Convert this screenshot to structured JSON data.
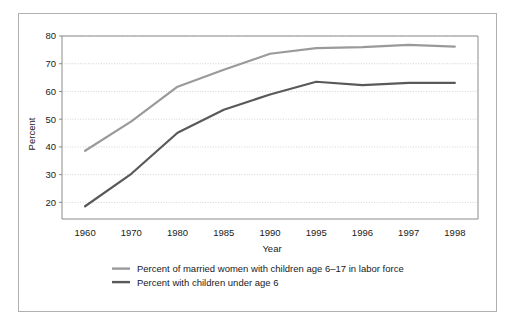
{
  "chart_data": {
    "type": "line",
    "title": "",
    "xlabel": "Year",
    "ylabel": "Percent",
    "categories": [
      "1960",
      "1970",
      "1980",
      "1985",
      "1990",
      "1995",
      "1996",
      "1997",
      "1998"
    ],
    "ylim": [
      14,
      80
    ],
    "ytick_labels": [
      "20",
      "30",
      "40",
      "50",
      "60",
      "70",
      "80"
    ],
    "yticks": [
      20,
      30,
      40,
      50,
      60,
      70,
      80
    ],
    "grid": true,
    "grid_style": "dotted-horizontal",
    "legend_position": "bottom",
    "series": [
      {
        "name": "Percent of married women with children age 6–17 in labor force",
        "color": "#9a9a9a",
        "values": [
          38.6,
          49.2,
          61.7,
          67.8,
          73.6,
          75.6,
          76.0,
          76.8,
          76.2
        ]
      },
      {
        "name": "Percent with children under age 6",
        "color": "#595959",
        "values": [
          18.6,
          30.3,
          45.1,
          53.4,
          58.9,
          63.5,
          62.3,
          63.1,
          63.1
        ]
      }
    ]
  },
  "figure": {
    "border_color": "#b0b0b0",
    "background": "#ffffff",
    "axis_color": "#8c8c8c",
    "grid_color": "#c8c8c8",
    "text_color": "#1a1a1a"
  }
}
